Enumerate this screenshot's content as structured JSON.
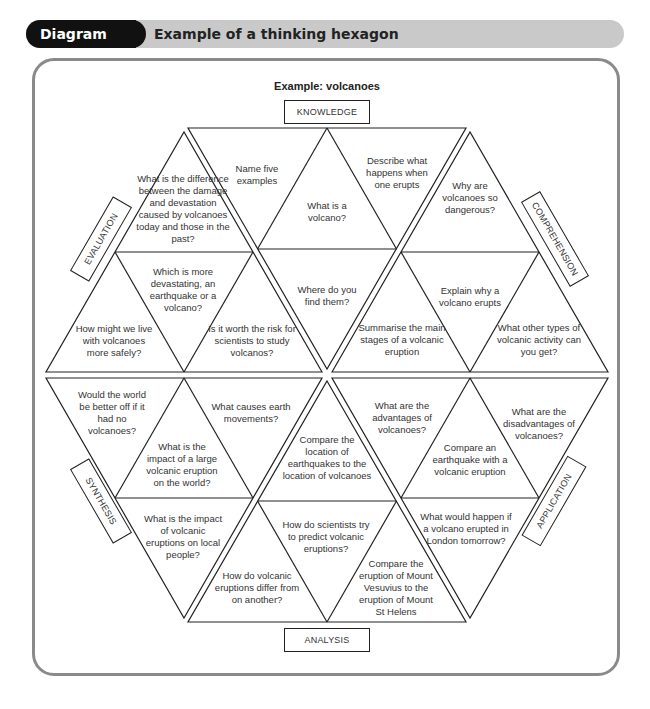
{
  "header": {
    "tag": "Diagram 3.2",
    "title": "Example of a thinking hexagon"
  },
  "diagram": {
    "title": "Example: volcanoes",
    "labels": {
      "knowledge": "KNOWLEDGE",
      "comprehension": "COMPREHENSION",
      "application": "APPLICATION",
      "analysis": "ANALYSIS",
      "synthesis": "SYNTHESIS",
      "evaluation": "EVALUATION"
    },
    "knowledge": [
      "Name five examples",
      "What is a volcano?",
      "Describe what happens when one erupts",
      "Where do you find them?"
    ],
    "comprehension": [
      "Why are volcanoes so dangerous?",
      "Explain why a volcano erupts",
      "Summarise the main stages of a volcanic eruption",
      "What other types of volcanic activity can you get?"
    ],
    "application": [
      "What are the advantages of volcanoes?",
      "What are the disadvantages of volcanoes?",
      "Compare an earthquake with a volcanic eruption",
      "What would happen if a volcano erupted in London tomorrow?"
    ],
    "analysis": [
      "Compare the location of earthquakes to the location of volcanoes",
      "How do scientists try to predict volcanic eruptions?",
      "How do volcanic eruptions differ from on another?",
      "Compare the eruption of Mount Vesuvius to the eruption of Mount St Helens"
    ],
    "synthesis": [
      "Would the world be better off if it had no volcanoes?",
      "What causes earth movements?",
      "What is the impact of a large volcanic eruption on the world?",
      "What is the impact of volcanic eruptions on local people?"
    ],
    "evaluation": [
      "What is the difference between the damage and devastation caused by volcanoes today and those in the past?",
      "Which is more devastating, an earthquake or a volcano?",
      "How might we live with volcanoes more safely?",
      "Is it worth the risk for scientists to study volcanos?"
    ]
  }
}
